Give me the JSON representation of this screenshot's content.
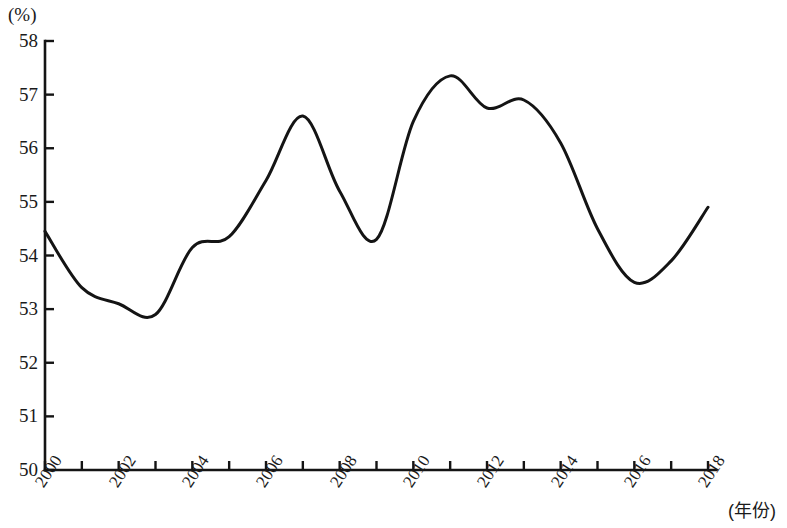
{
  "chart_data": {
    "type": "line",
    "title": "",
    "subtitle": "",
    "xlabel": "(年份)",
    "ylabel": "(%)",
    "unit_label": "(%)",
    "xlim": [
      1999.5,
      2018.5
    ],
    "ylim": [
      50,
      58
    ],
    "grid": false,
    "legend": false,
    "legend_position": "none",
    "line_color": "#141414",
    "background_color": "#ffffff",
    "axis_color": "#141414",
    "y_ticks": [
      58,
      57,
      56,
      55,
      54,
      53,
      52,
      51,
      50
    ],
    "y_tick_labels": [
      "58",
      "57",
      "56",
      "55",
      "54",
      "53",
      "52",
      "51",
      "50"
    ],
    "x_ticks": [
      2000,
      2001,
      2002,
      2003,
      2004,
      2005,
      2006,
      2007,
      2008,
      2009,
      2010,
      2011,
      2012,
      2013,
      2014,
      2015,
      2016,
      2017,
      2018
    ],
    "x_tick_labels_shown": [
      "2000",
      "2002",
      "2004",
      "2006",
      "2008",
      "2010",
      "2012",
      "2014",
      "2016",
      "2018"
    ],
    "x": [
      2000,
      2001,
      2002,
      2003,
      2004,
      2005,
      2006,
      2007,
      2008,
      2009,
      2010,
      2011,
      2012,
      2013,
      2014,
      2015,
      2016,
      2017,
      2018
    ],
    "values": [
      54.45,
      53.4,
      53.1,
      52.9,
      54.15,
      54.35,
      55.4,
      56.6,
      55.2,
      54.3,
      56.5,
      57.35,
      56.75,
      56.9,
      56.1,
      54.5,
      53.5,
      53.9,
      54.9
    ],
    "series": [
      {
        "name": "",
        "values": [
          54.45,
          53.4,
          53.1,
          52.9,
          54.15,
          54.35,
          55.4,
          56.6,
          55.2,
          54.3,
          56.5,
          57.35,
          56.75,
          56.9,
          56.1,
          54.5,
          53.5,
          53.9,
          54.9
        ]
      }
    ],
    "annotations": []
  }
}
